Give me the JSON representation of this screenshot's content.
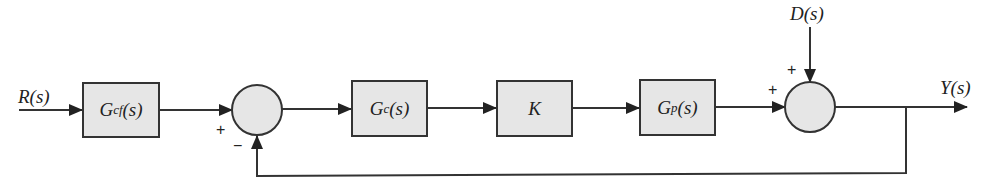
{
  "diagram": {
    "type": "feedback control block diagram",
    "signals": {
      "input": "R(s)",
      "disturbance": "D(s)",
      "output": "Y(s)"
    },
    "blocks": [
      {
        "id": "prefilter",
        "label": "Gcf(s)",
        "main": "G",
        "sub": "cf",
        "arg": "(s)"
      },
      {
        "id": "controller",
        "label": "Gc(s)",
        "main": "G",
        "sub": "c",
        "arg": "(s)"
      },
      {
        "id": "gain",
        "label": "K",
        "main": "K",
        "sub": "",
        "arg": ""
      },
      {
        "id": "plant",
        "label": "Gp(s)",
        "main": "G",
        "sub": "p",
        "arg": "(s)"
      }
    ],
    "summing_junctions": [
      {
        "id": "error-sum",
        "signs": {
          "reference": "+",
          "feedback": "−"
        }
      },
      {
        "id": "disturbance-sum",
        "signs": {
          "plant": "+",
          "disturbance": "+"
        }
      }
    ],
    "colors": {
      "block_fill": "#e6e6e6",
      "stroke": "#333333"
    }
  }
}
